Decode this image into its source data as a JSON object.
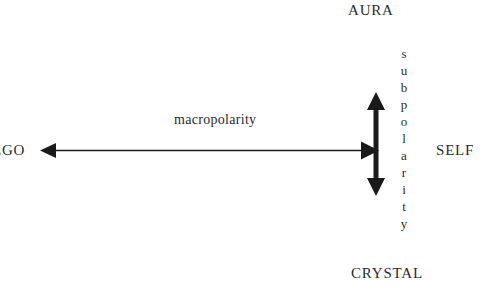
{
  "diagram": {
    "background_color": "#ffffff",
    "ink_color": "#1a1a1a",
    "poles": {
      "top": "AURA",
      "bottom": "CRYSTAL",
      "left": "EGO",
      "right": "SELF"
    },
    "axes": {
      "horizontal_label": "macropolarity",
      "vertical_label": "subpolarity",
      "vertical_label_letters": [
        "s",
        "u",
        "b",
        "p",
        "o",
        "l",
        "a",
        "r",
        "i",
        "t",
        "y"
      ]
    },
    "arrows": {
      "horizontal": {
        "name": "macropolarity-axis-arrow",
        "style": "double-headed",
        "from_x": 40,
        "to_x": 379,
        "y": 150,
        "stroke_width": 1.6
      },
      "vertical": {
        "name": "subpolarity-axis-arrow",
        "style": "double-headed",
        "x": 376,
        "from_y": 92,
        "to_y": 196,
        "stroke_width": 5
      }
    }
  }
}
